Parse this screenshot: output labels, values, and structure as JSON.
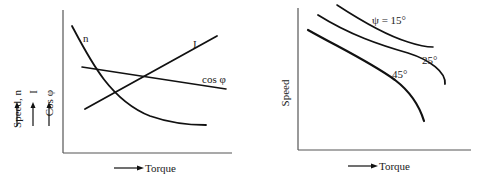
{
  "figures": [
    {
      "id": "left",
      "x_axis_label": "Torque",
      "y_axis_labels": [
        "Speed, n",
        "I",
        "Cos φ"
      ],
      "curves": [
        {
          "name": "speed",
          "label": "n",
          "trend": "decreasing, concave up"
        },
        {
          "name": "current",
          "label": "I",
          "trend": "increasing, linear"
        },
        {
          "name": "power-factor",
          "label": "cos φ",
          "trend": "slightly decreasing, linear"
        }
      ]
    },
    {
      "id": "right",
      "x_axis_label": "Torque",
      "y_axis_label": "Speed",
      "curves": [
        {
          "name": "psi-15",
          "label": "ψ = 15°"
        },
        {
          "name": "psi-25",
          "label": "25°"
        },
        {
          "name": "psi-45",
          "label": "45°"
        }
      ]
    }
  ]
}
